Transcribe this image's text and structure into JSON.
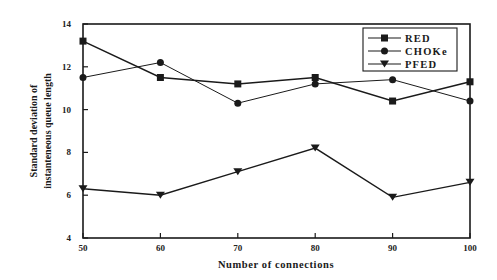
{
  "chart_data": {
    "type": "line",
    "title": "",
    "xlabel": "Number of connections",
    "ylabel": [
      "Standard deviation of",
      "instanteneous queue length"
    ],
    "x": [
      50,
      60,
      70,
      80,
      90,
      100
    ],
    "xlim": [
      50,
      100
    ],
    "ylim": [
      4,
      14
    ],
    "xticks": [
      "50",
      "60",
      "70",
      "80",
      "90",
      "100"
    ],
    "yticks": [
      "4",
      "6",
      "8",
      "10",
      "12",
      "14"
    ],
    "grid": false,
    "legend_position": "upper right",
    "series": [
      {
        "name": "RED",
        "marker": "square",
        "color": "#1a1a1a",
        "values": [
          13.2,
          11.5,
          11.2,
          11.5,
          10.4,
          11.3
        ]
      },
      {
        "name": "CHOKe",
        "marker": "circle",
        "color": "#1a1a1a",
        "values": [
          11.5,
          12.2,
          10.3,
          11.2,
          11.4,
          10.4
        ]
      },
      {
        "name": "PFED",
        "marker": "triangle-down",
        "color": "#1a1a1a",
        "values": [
          6.3,
          6.0,
          7.1,
          8.2,
          5.9,
          6.6
        ]
      }
    ]
  }
}
